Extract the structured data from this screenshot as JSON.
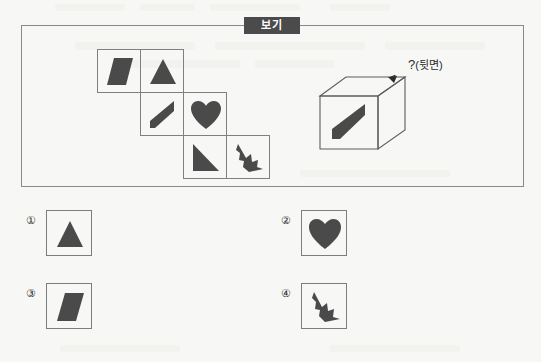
{
  "page": {
    "background_color": "#f7f7f5",
    "ink_color": "#4a4a4a",
    "line_color": "#808080"
  },
  "boki": {
    "label": "보기",
    "label_bg": "#4b4b4b",
    "label_fg": "#ffffff"
  },
  "net": {
    "description": "unfolded cube net in staircase arrangement",
    "cells": [
      {
        "id": "net-cell-parallelogram",
        "shape": "parallelogram",
        "col": 0,
        "row": 0
      },
      {
        "id": "net-cell-triangle",
        "shape": "triangle",
        "col": 1,
        "row": 0
      },
      {
        "id": "net-cell-slash",
        "shape": "slash-wedge",
        "col": 1,
        "row": 1
      },
      {
        "id": "net-cell-heart",
        "shape": "heart",
        "col": 2,
        "row": 1
      },
      {
        "id": "net-cell-right-triangle",
        "shape": "right-triangle",
        "col": 2,
        "row": 2
      },
      {
        "id": "net-cell-arrow",
        "shape": "jagged-arrow",
        "col": 3,
        "row": 2
      }
    ]
  },
  "cube": {
    "front_face_shape": "slash-wedge",
    "arrow_label": "?(뒷면)",
    "arrow_label_question": "?",
    "arrow_label_paren": "(뒷면)"
  },
  "options": [
    {
      "number": "①",
      "name": "option-1",
      "shape": "triangle"
    },
    {
      "number": "②",
      "name": "option-2",
      "shape": "heart"
    },
    {
      "number": "③",
      "name": "option-3",
      "shape": "parallelogram"
    },
    {
      "number": "④",
      "name": "option-4",
      "shape": "jagged-arrow"
    }
  ]
}
